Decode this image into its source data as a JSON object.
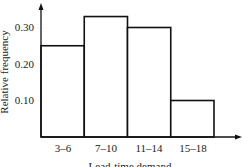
{
  "chart_data": {
    "type": "bar",
    "title": "",
    "xlabel": "Lead-time demand",
    "ylabel": "Relative frequency",
    "categories": [
      "3–6",
      "7–10",
      "11–14",
      "15–18"
    ],
    "values": [
      0.25,
      0.33,
      0.3,
      0.1
    ],
    "yticks": [
      "0.10",
      "0.20",
      "0.30"
    ],
    "ylim": [
      0,
      0.35
    ],
    "grid": false,
    "legend": null,
    "bar_style": "histogram, no gaps, white fill, black outline"
  },
  "colors": {
    "stroke": "#111111",
    "fill": "#ffffff"
  }
}
